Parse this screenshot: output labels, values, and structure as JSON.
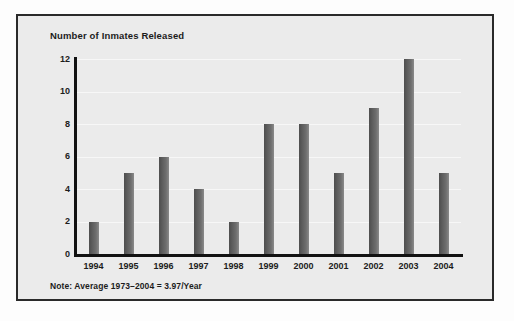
{
  "figure": {
    "background_color": "#fdfdfd",
    "panel_color": "#ebebeb",
    "border_color": "#2a2a2a",
    "bar_color": "#5e5e5e",
    "axis_color": "#111111",
    "gridline_color": "#f7f7f7"
  },
  "chart_data": {
    "type": "bar",
    "title": "Number of Inmates Released",
    "xlabel": "",
    "ylabel": "",
    "categories": [
      "1994",
      "1995",
      "1996",
      "1997",
      "1998",
      "1999",
      "2000",
      "2001",
      "2002",
      "2003",
      "2004"
    ],
    "values": [
      2,
      5,
      6,
      4,
      2,
      8,
      8,
      5,
      9,
      12,
      5
    ],
    "ylim": [
      0,
      12
    ],
    "yticks": [
      0,
      2,
      4,
      6,
      8,
      10,
      12
    ],
    "ytick_labels": [
      "0",
      "2",
      "4",
      "6",
      "8",
      "10",
      "12"
    ],
    "grid": true,
    "grid_axis": "y",
    "legend": false,
    "note": "Note: Average 1973–2004 = 3.97/Year"
  }
}
